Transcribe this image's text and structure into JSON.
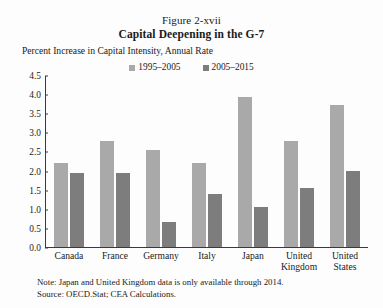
{
  "figure": {
    "number": "Figure 2-xvii",
    "title": "Capital Deepening in the G-7",
    "axis_note": "Percent Increase in Capital Intensity, Annual Rate",
    "note": "Note: Japan and United Kingdom data is only available through 2014.",
    "source": "Source: OECD.Stat; CEA Calculations."
  },
  "colors": {
    "series_1995_2005": "#a9a9a9",
    "series_2005_2015": "#7d7d7d",
    "axis": "#3a3a3a",
    "background": "#fdfdfd",
    "text": "#1a1a1a"
  },
  "chart_data": {
    "type": "bar",
    "title": "Capital Deepening in the G-7",
    "subtitle": "Figure 2-xvii",
    "xlabel": "",
    "ylabel": "Percent Increase in Capital Intensity, Annual Rate",
    "ylim": [
      0.0,
      4.5
    ],
    "ytick_step": 0.5,
    "yticks": [
      "0.0",
      "0.5",
      "1.0",
      "1.5",
      "2.0",
      "2.5",
      "3.0",
      "3.5",
      "4.0",
      "4.5"
    ],
    "ytick_values": [
      0.0,
      0.5,
      1.0,
      1.5,
      2.0,
      2.5,
      3.0,
      3.5,
      4.0,
      4.5
    ],
    "grid": false,
    "legend_position": "top-center",
    "categories": [
      "Canada",
      "France",
      "Germany",
      "Italy",
      "Japan",
      "United Kingdom",
      "United States"
    ],
    "category_lines": [
      [
        "Canada"
      ],
      [
        "France"
      ],
      [
        "Germany"
      ],
      [
        "Italy"
      ],
      [
        "Japan"
      ],
      [
        "United",
        "Kingdom"
      ],
      [
        "United",
        "States"
      ]
    ],
    "series": [
      {
        "name": "1995–2005",
        "color": "#a9a9a9",
        "values": [
          2.2,
          2.8,
          2.55,
          2.2,
          3.95,
          2.8,
          3.75
        ]
      },
      {
        "name": "2005–2015",
        "color": "#7d7d7d",
        "values": [
          1.95,
          1.95,
          0.65,
          1.4,
          1.05,
          1.55,
          2.0
        ]
      }
    ]
  }
}
